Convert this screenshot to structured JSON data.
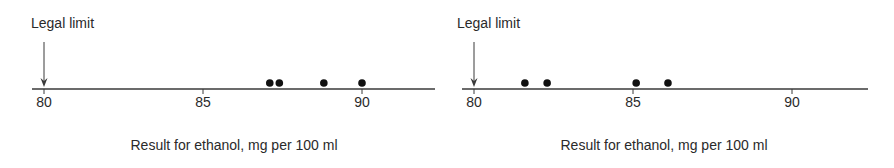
{
  "chart_data": [
    {
      "type": "scatter",
      "title": "",
      "annotation": "Legal limit",
      "annotation_x": 80,
      "xlabel": "Result for ethanol, mg per 100 ml",
      "ylabel": "",
      "xlim": [
        79.6,
        92.3
      ],
      "xticks": [
        80,
        85,
        90
      ],
      "tick_labels": [
        "80",
        "85",
        "90"
      ],
      "grid": false,
      "legend": null,
      "values": [
        87.1,
        87.4,
        88.8,
        90.0
      ]
    },
    {
      "type": "scatter",
      "title": "",
      "annotation": "Legal limit",
      "annotation_x": 80,
      "xlabel": "Result for ethanol, mg per 100 ml",
      "ylabel": "",
      "xlim": [
        79.6,
        92.3
      ],
      "xticks": [
        80,
        85,
        90
      ],
      "tick_labels": [
        "80",
        "85",
        "90"
      ],
      "grid": false,
      "legend": null,
      "values": [
        81.6,
        82.3,
        85.1,
        86.1
      ]
    }
  ],
  "colors": {
    "axis": "#3a3a3a",
    "dot": "#111111",
    "text": "#2a2a2a"
  }
}
